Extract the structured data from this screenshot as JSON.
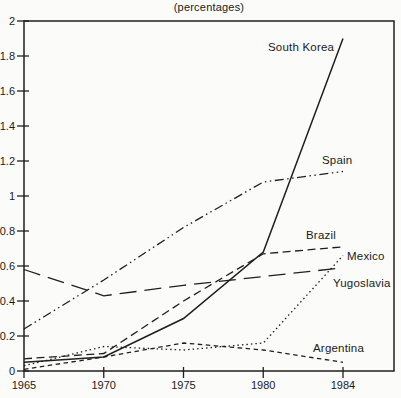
{
  "chart_data": {
    "type": "line",
    "title": "(percentages)",
    "categories": [
      "1965",
      "1970",
      "1975",
      "1980",
      "1984"
    ],
    "ylim": [
      0,
      2
    ],
    "ytick_step": 0.2,
    "grid": false,
    "legend": "inline-labels",
    "axis_color": "#1f1f1f",
    "line_color": "#1f1f1f",
    "background": "#fbfbf9",
    "series": [
      {
        "name": "South Korea",
        "line_style": "solid",
        "values": [
          0.05,
          0.08,
          0.3,
          0.68,
          1.9
        ],
        "label_px": [
          268,
          41
        ]
      },
      {
        "name": "Spain",
        "line_style": "dash-dot-dot",
        "values": [
          0.24,
          0.52,
          0.82,
          1.08,
          1.14
        ],
        "label_px": [
          322,
          154
        ]
      },
      {
        "name": "Brazil",
        "line_style": "medium-dash",
        "values": [
          0.07,
          0.1,
          0.4,
          0.67,
          0.71
        ],
        "label_px": [
          306,
          229
        ]
      },
      {
        "name": "Mexico",
        "line_style": "dotted",
        "values": [
          0.03,
          0.14,
          0.12,
          0.16,
          0.66
        ],
        "label_px": [
          347,
          250
        ]
      },
      {
        "name": "Yugoslavia",
        "line_style": "long-dash",
        "values": [
          0.58,
          0.43,
          0.49,
          0.54,
          0.59
        ],
        "label_px": [
          333,
          277
        ]
      },
      {
        "name": "Argentina",
        "line_style": "short-dash",
        "values": [
          0.01,
          0.08,
          0.16,
          0.12,
          0.05
        ],
        "label_px": [
          313,
          342
        ]
      }
    ]
  }
}
